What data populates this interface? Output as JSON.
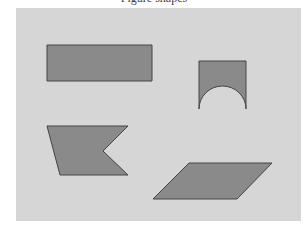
{
  "caption": "Figure shapes",
  "colors": {
    "background": "#ffffff",
    "panel": "#d6d6d6",
    "shape_fill": "#8a8a8a",
    "shape_stroke": "#444444"
  },
  "shapes": [
    {
      "name": "rectangle",
      "points": "47,45 152,45 152,81 47,81"
    },
    {
      "name": "arch",
      "path": "M199,61 L246,61 L246,109 A23.5,23 0 0 0 199,109 Z"
    },
    {
      "name": "flag-pentagon",
      "points": "47,126 128,126 103,151 128,175 60,175"
    },
    {
      "name": "parallelogram",
      "points": "189,163 272,163 237,199 153,199"
    }
  ]
}
